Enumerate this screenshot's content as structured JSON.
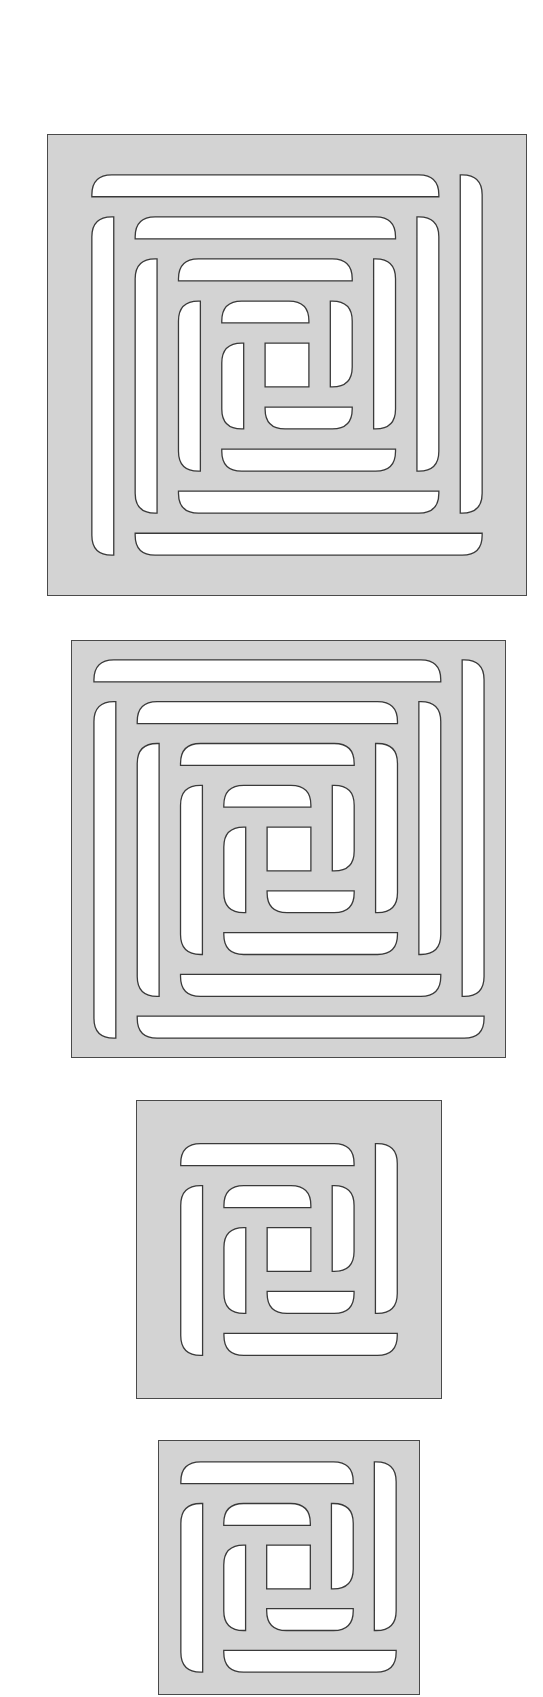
{
  "canvas": {
    "width": 543,
    "height": 1697,
    "background": "#ffffff"
  },
  "colors": {
    "panel_fill": "#d3d3d3",
    "panel_border": "#4a4a4a",
    "slot_fill": "#ffffff",
    "slot_stroke": "#3a3a3a"
  },
  "panels": [
    {
      "id": "panel-1",
      "label": "Large grille, 4 rings, wide margin",
      "x": 47,
      "y": 134,
      "w": 480,
      "h": 462,
      "rings": 4,
      "pattern": {
        "ox": 44,
        "oy": 40,
        "w": 392,
        "h": 382
      }
    },
    {
      "id": "panel-2",
      "label": "Large grille, 4 rings, narrow margin",
      "x": 71,
      "y": 640,
      "w": 435,
      "h": 418,
      "rings": 4,
      "pattern": {
        "ox": 22,
        "oy": 19,
        "w": 392,
        "h": 380
      }
    },
    {
      "id": "panel-3",
      "label": "Small grille, 2 rings, wide margin",
      "x": 136,
      "y": 1100,
      "w": 306,
      "h": 299,
      "rings": 2,
      "pattern": {
        "ox": 44,
        "oy": 43,
        "w": 218,
        "h": 213
      }
    },
    {
      "id": "panel-4",
      "label": "Small grille, 2 rings, narrow margin",
      "x": 158,
      "y": 1440,
      "w": 262,
      "h": 255,
      "rings": 2,
      "pattern": {
        "ox": 22,
        "oy": 21,
        "w": 217,
        "h": 212
      }
    }
  ],
  "slot": {
    "thickness": 22,
    "corner_radius": 20
  }
}
